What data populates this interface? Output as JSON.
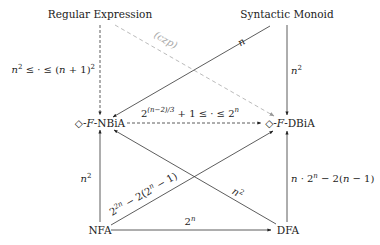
{
  "nodes": {
    "regex": "Regular Expression",
    "monoid": "Syntactic Monoid",
    "nbia_prefix": "◇-",
    "nbia_F": "F",
    "nbia_suffix": "-NBiA",
    "dbia_prefix": "◇-",
    "dbia_F": "F",
    "dbia_suffix": "-DBiA",
    "nfa": "NFA",
    "dfa": "DFA"
  },
  "edges": [
    {
      "from": "Regular Expression",
      "to": "◇F-NBiA",
      "style": "dashed",
      "label": "n² ≤ · ≤ (n + 1)²"
    },
    {
      "from": "Regular Expression",
      "to": "◇F-DBiA",
      "style": "gray-dashed",
      "label": "(czp)"
    },
    {
      "from": "Syntactic Monoid",
      "to": "◇F-NBiA",
      "style": "solid",
      "label": "n"
    },
    {
      "from": "Syntactic Monoid",
      "to": "◇F-DBiA",
      "style": "solid",
      "label": "n²"
    },
    {
      "from": "◇F-NBiA",
      "to": "◇F-DBiA",
      "style": "dashed",
      "label": "2^((n−2)/3) + 1 ≤ · ≤ 2^n"
    },
    {
      "from": "NFA",
      "to": "◇F-NBiA",
      "style": "solid",
      "label": "n²"
    },
    {
      "from": "NFA",
      "to": "◇F-DBiA",
      "style": "solid",
      "label": "2^(2n) − 2(2^n − 1)"
    },
    {
      "from": "DFA",
      "to": "◇F-NBiA",
      "style": "solid",
      "label": "n²"
    },
    {
      "from": "DFA",
      "to": "◇F-DBiA",
      "style": "solid",
      "label": "n · 2^n − 2(n − 1)"
    },
    {
      "from": "NFA",
      "to": "DFA",
      "style": "solid",
      "label": "2^n"
    }
  ],
  "labels": {
    "regex_nbia_a": "n",
    "regex_nbia_b": "2",
    "regex_nbia_c": " ≤ · ≤ (",
    "regex_nbia_d": "n",
    "regex_nbia_e": " + 1)",
    "regex_nbia_f": "2",
    "czp": "(czp)",
    "monoid_nbia": "n",
    "monoid_dbia_base": "n",
    "monoid_dbia_exp": "2",
    "nbia_dbia_base": "2",
    "nbia_dbia_exp": "(n−2)/3",
    "nbia_dbia_rest": " + 1 ≤ · ≤ 2",
    "nbia_dbia_exp2": "n",
    "nfa_nbia_base": "n",
    "nfa_nbia_exp": "2",
    "nfa_dbia_a": "2",
    "nfa_dbia_b": "2n",
    "nfa_dbia_c": " − 2(2",
    "nfa_dbia_d": "n",
    "nfa_dbia_e": " − 1)",
    "dfa_nbia_base": "n",
    "dfa_nbia_exp": "2",
    "dfa_dbia_a": "n",
    "dfa_dbia_b": " · 2",
    "dfa_dbia_c": "n",
    "dfa_dbia_d": " − 2(",
    "dfa_dbia_e": "n",
    "dfa_dbia_f": " − 1)",
    "nfa_dfa_base": "2",
    "nfa_dfa_exp": "n"
  }
}
